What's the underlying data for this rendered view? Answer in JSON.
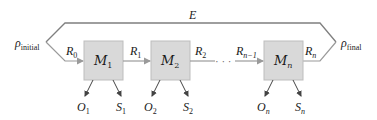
{
  "diagram": {
    "type": "sequential-process",
    "environment_label": "E",
    "start": {
      "symbol": "ρ",
      "subscript": "initial"
    },
    "end": {
      "symbol": "ρ",
      "subscript": "final"
    },
    "modules": [
      {
        "symbol": "M",
        "subscript": "1",
        "outputs": [
          {
            "symbol": "O",
            "subscript": "1"
          },
          {
            "symbol": "S",
            "subscript": "1"
          }
        ]
      },
      {
        "symbol": "M",
        "subscript": "2",
        "outputs": [
          {
            "symbol": "O",
            "subscript": "2"
          },
          {
            "symbol": "S",
            "subscript": "2"
          }
        ]
      },
      {
        "symbol": "M",
        "subscript": "n",
        "outputs": [
          {
            "symbol": "O",
            "subscript": "n"
          },
          {
            "symbol": "S",
            "subscript": "n"
          }
        ]
      }
    ],
    "edges": [
      {
        "symbol": "R",
        "subscript": "0"
      },
      {
        "symbol": "R",
        "subscript": "1"
      },
      {
        "symbol": "R",
        "subscript": "2"
      },
      {
        "symbol": "R",
        "subscript": "n−1"
      },
      {
        "symbol": "R",
        "subscript": "n"
      }
    ],
    "ellipsis": "· · ·",
    "colors": {
      "box_fill": "#d9d9d9",
      "box_stroke": "#b5b5b5",
      "line": "#8c8c8c",
      "arrow": "#555555",
      "text": "#1a1a1a"
    }
  }
}
